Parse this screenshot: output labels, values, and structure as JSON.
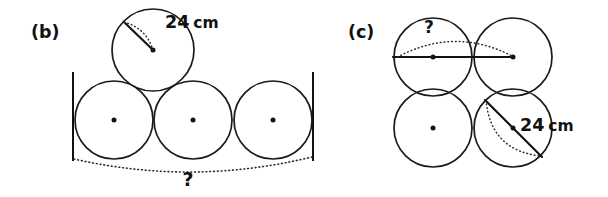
{
  "figure": {
    "title_visible": false,
    "background_color": "#ffffff",
    "ink_color": "#111111",
    "panels": [
      {
        "id": "b",
        "label": "(b)",
        "label_x": 31,
        "label_y": 38,
        "dimension_label": {
          "value": "24",
          "unit": "cm",
          "x": 165,
          "y": 28
        },
        "unknown_label": {
          "text": "?",
          "x": 188,
          "y": 186
        },
        "top_circle": {
          "cx": 153,
          "cy": 50,
          "r": 41
        },
        "bottom_circles": [
          {
            "cx": 114,
            "cy": 120,
            "r": 39
          },
          {
            "cx": 193,
            "cy": 120,
            "r": 39
          },
          {
            "cx": 273,
            "cy": 120,
            "r": 39
          }
        ],
        "left_bar": {
          "x": 73,
          "y1": 72,
          "y2": 161
        },
        "right_bar": {
          "x": 313,
          "y1": 72,
          "y2": 161
        },
        "radius_line": {
          "x1": 153,
          "y1": 50,
          "x2": 124,
          "y2": 22
        },
        "baseline_arc": {
          "x1": 74,
          "y1": 159,
          "x2": 312,
          "y2": 157,
          "sag": 14
        }
      },
      {
        "id": "c",
        "label": "(c)",
        "label_x": 348,
        "label_y": 38,
        "dimension_label": {
          "value": "24",
          "unit": "cm",
          "x": 520,
          "y": 131
        },
        "unknown_label": {
          "text": "?",
          "x": 429,
          "y": 33
        },
        "circles": [
          {
            "cx": 433,
            "cy": 57,
            "r": 39,
            "position": "top-left",
            "has_center_dot": true
          },
          {
            "cx": 513,
            "cy": 57,
            "r": 39,
            "position": "top-right",
            "has_center_dot": true
          },
          {
            "cx": 433,
            "cy": 128,
            "r": 39,
            "position": "bottom-left",
            "has_center_dot": true
          },
          {
            "cx": 513,
            "cy": 128,
            "r": 39,
            "position": "bottom-right",
            "has_center_dot": true
          }
        ],
        "horizontal_line": {
          "x1": 393,
          "y1": 57,
          "x2": 513,
          "y2": 57
        },
        "top_dotted_arc": {
          "x1": 394,
          "y1": 59,
          "x2": 512,
          "y2": 56,
          "rise": 16
        },
        "diagonal_line": {
          "x1": 485,
          "y1": 100,
          "x2": 542,
          "y2": 157
        },
        "diagonal_dotted_arc": {
          "x1": 486,
          "y1": 100,
          "x2": 541,
          "y2": 156,
          "bulge": 17
        }
      }
    ]
  }
}
